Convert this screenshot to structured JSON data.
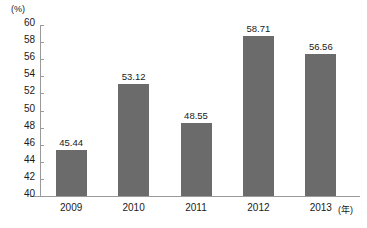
{
  "chart_data": {
    "type": "bar",
    "title": "",
    "subtitle": "",
    "categories": [
      "2009",
      "2010",
      "2011",
      "2012",
      "2013"
    ],
    "values": [
      45.44,
      53.12,
      48.55,
      58.71,
      56.56
    ],
    "value_labels": [
      "45.44",
      "53.12",
      "48.55",
      "58.71",
      "56.56"
    ],
    "xlabel": "(年)",
    "ylabel": "(%)",
    "ylim": [
      40,
      60
    ],
    "yticks": [
      40,
      42,
      44,
      46,
      48,
      50,
      52,
      54,
      56,
      58,
      60
    ],
    "ytick_labels": [
      "40",
      "42",
      "44",
      "46",
      "48",
      "50",
      "52",
      "54",
      "56",
      "58",
      "60"
    ],
    "grid": false,
    "legend": null,
    "series": [
      {
        "name": "",
        "values": [
          45.44,
          53.12,
          48.55,
          58.71,
          56.56
        ]
      }
    ],
    "colors": {
      "bar": "#6b6b6b",
      "axis": "#9a9a9a",
      "text": "#1a1a1a",
      "background": "#ffffff"
    }
  }
}
